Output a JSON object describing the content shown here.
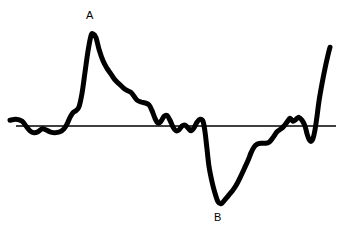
{
  "figure": {
    "title": "",
    "background_color": "#ffffff",
    "width": 343,
    "height": 238
  },
  "annotations": {
    "peak_label": "A",
    "trough_label": "B"
  },
  "chart_data": {
    "type": "line",
    "title": "",
    "xlabel": "",
    "ylabel": "",
    "grid": false,
    "legend": null,
    "axis": {
      "baseline_y": 0,
      "baseline_x_start": 16,
      "baseline_x_end": 336,
      "baseline_color": "#000000",
      "baseline_width": 1
    },
    "xlim": [
      0,
      343
    ],
    "ylim": [
      -85,
      100
    ],
    "trace": {
      "name": "waveform",
      "color": "#000000",
      "line_width": 5,
      "description": "Irregular oscillating trace with a tall positive peak labeled A, a deep negative trough labeled B, and a steep terminal upswing at the right edge.",
      "annotated_points": [
        {
          "label": "A",
          "x": 92,
          "y": 96,
          "kind": "peak"
        },
        {
          "label": "B",
          "x": 220,
          "y": -81,
          "kind": "trough"
        }
      ],
      "points": [
        [
          10,
          6
        ],
        [
          16,
          7
        ],
        [
          22,
          5
        ],
        [
          26,
          0
        ],
        [
          30,
          -5
        ],
        [
          34,
          -7
        ],
        [
          38,
          -6
        ],
        [
          42,
          -3
        ],
        [
          46,
          -4
        ],
        [
          50,
          -6
        ],
        [
          55,
          -7
        ],
        [
          60,
          -6
        ],
        [
          64,
          -3
        ],
        [
          67,
          2
        ],
        [
          70,
          9
        ],
        [
          73,
          14
        ],
        [
          76,
          16
        ],
        [
          79,
          20
        ],
        [
          82,
          34
        ],
        [
          85,
          56
        ],
        [
          88,
          78
        ],
        [
          91,
          94
        ],
        [
          93,
          96
        ],
        [
          96,
          92
        ],
        [
          99,
          80
        ],
        [
          103,
          68
        ],
        [
          107,
          60
        ],
        [
          111,
          54
        ],
        [
          115,
          48
        ],
        [
          119,
          44
        ],
        [
          123,
          40
        ],
        [
          127,
          37
        ],
        [
          131,
          35
        ],
        [
          134,
          31
        ],
        [
          137,
          27
        ],
        [
          141,
          25
        ],
        [
          145,
          24
        ],
        [
          149,
          22
        ],
        [
          152,
          16
        ],
        [
          155,
          8
        ],
        [
          158,
          3
        ],
        [
          161,
          5
        ],
        [
          164,
          10
        ],
        [
          167,
          11
        ],
        [
          170,
          6
        ],
        [
          173,
          -1
        ],
        [
          176,
          -5
        ],
        [
          179,
          -4
        ],
        [
          182,
          0
        ],
        [
          185,
          1
        ],
        [
          188,
          -2
        ],
        [
          191,
          -5
        ],
        [
          194,
          -2
        ],
        [
          197,
          4
        ],
        [
          200,
          7
        ],
        [
          203,
          5
        ],
        [
          205,
          -6
        ],
        [
          207,
          -24
        ],
        [
          209,
          -42
        ],
        [
          212,
          -58
        ],
        [
          215,
          -70
        ],
        [
          218,
          -79
        ],
        [
          221,
          -81
        ],
        [
          224,
          -78
        ],
        [
          228,
          -73
        ],
        [
          232,
          -68
        ],
        [
          236,
          -62
        ],
        [
          240,
          -54
        ],
        [
          244,
          -45
        ],
        [
          248,
          -36
        ],
        [
          251,
          -28
        ],
        [
          254,
          -22
        ],
        [
          257,
          -19
        ],
        [
          261,
          -18
        ],
        [
          265,
          -18
        ],
        [
          269,
          -17
        ],
        [
          273,
          -12
        ],
        [
          277,
          -6
        ],
        [
          281,
          -3
        ],
        [
          284,
          0
        ],
        [
          287,
          4
        ],
        [
          290,
          8
        ],
        [
          293,
          5
        ],
        [
          296,
          7
        ],
        [
          299,
          9
        ],
        [
          302,
          6
        ],
        [
          305,
          0
        ],
        [
          307,
          -8
        ],
        [
          309,
          -14
        ],
        [
          311,
          -16
        ],
        [
          313,
          -13
        ],
        [
          315,
          -4
        ],
        [
          317,
          10
        ],
        [
          319,
          26
        ],
        [
          322,
          44
        ],
        [
          325,
          60
        ],
        [
          328,
          74
        ],
        [
          330,
          82
        ]
      ]
    }
  }
}
